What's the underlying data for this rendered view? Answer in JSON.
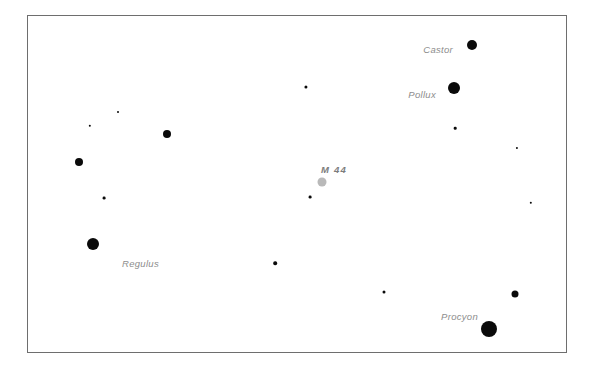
{
  "chart_data": {
    "type": "scatter",
    "title": "",
    "xlabel": "",
    "ylabel": "",
    "grid": false,
    "legend": "none",
    "background": "#ffffff",
    "frame": {
      "x": 27,
      "y": 15,
      "width": 540,
      "height": 338,
      "border_color": "#6e6e6e",
      "border_width": 1
    },
    "xlim": [
      0,
      540
    ],
    "ylim": [
      0,
      338
    ],
    "label_color": "#8d8d8d",
    "star_color": "#0a0a0a",
    "cluster_color": "#b9b9b9",
    "points": [
      {
        "name": "castor",
        "label": "Castor",
        "x": 444,
        "y": 29,
        "r": 5.0,
        "kind": "star",
        "label_x": 425,
        "label_y": 33,
        "label_style": "italic"
      },
      {
        "name": "pollux",
        "label": "Pollux",
        "x": 426,
        "y": 72,
        "r": 6.0,
        "kind": "star",
        "label_x": 408,
        "label_y": 78,
        "label_style": "italic"
      },
      {
        "name": "regulus",
        "label": "Regulus",
        "x": 65,
        "y": 228,
        "r": 6.0,
        "kind": "star",
        "label_x": 131,
        "label_y": 247,
        "label_style": "italic"
      },
      {
        "name": "procyon",
        "label": "Procyon",
        "x": 461,
        "y": 313,
        "r": 8.0,
        "kind": "star",
        "label_x": 450,
        "label_y": 300,
        "label_style": "italic"
      },
      {
        "name": "m44-cluster",
        "label": "M 44",
        "x": 294,
        "y": 166,
        "r": 4.5,
        "kind": "cluster",
        "label_x": 306,
        "label_y": 153,
        "label_style": "bold-italic"
      },
      {
        "name": "star-mid-left",
        "label": "",
        "x": 139,
        "y": 118,
        "r": 4.0,
        "kind": "star"
      },
      {
        "name": "star-far-left",
        "label": "",
        "x": 51,
        "y": 146,
        "r": 4.0,
        "kind": "star"
      },
      {
        "name": "star-lower-right",
        "label": "",
        "x": 487,
        "y": 278,
        "r": 3.5,
        "kind": "star"
      },
      {
        "name": "star-faint-top",
        "label": "",
        "x": 278,
        "y": 71,
        "r": 1.6,
        "kind": "star"
      },
      {
        "name": "star-faint-a",
        "label": "",
        "x": 62,
        "y": 110,
        "r": 1.2,
        "kind": "star"
      },
      {
        "name": "star-faint-b",
        "label": "",
        "x": 90,
        "y": 96,
        "r": 1.0,
        "kind": "star"
      },
      {
        "name": "star-faint-c",
        "label": "",
        "x": 427,
        "y": 112,
        "r": 1.3,
        "kind": "star"
      },
      {
        "name": "star-faint-d",
        "label": "",
        "x": 489,
        "y": 132,
        "r": 1.1,
        "kind": "star"
      },
      {
        "name": "star-faint-e",
        "label": "",
        "x": 76,
        "y": 182,
        "r": 1.4,
        "kind": "star"
      },
      {
        "name": "star-faint-f",
        "label": "",
        "x": 282,
        "y": 181,
        "r": 1.4,
        "kind": "star"
      },
      {
        "name": "star-faint-g",
        "label": "",
        "x": 503,
        "y": 187,
        "r": 1.2,
        "kind": "star"
      },
      {
        "name": "star-faint-h",
        "label": "",
        "x": 247,
        "y": 247,
        "r": 1.8,
        "kind": "star"
      },
      {
        "name": "star-faint-i",
        "label": "",
        "x": 356,
        "y": 276,
        "r": 1.5,
        "kind": "star"
      }
    ]
  }
}
